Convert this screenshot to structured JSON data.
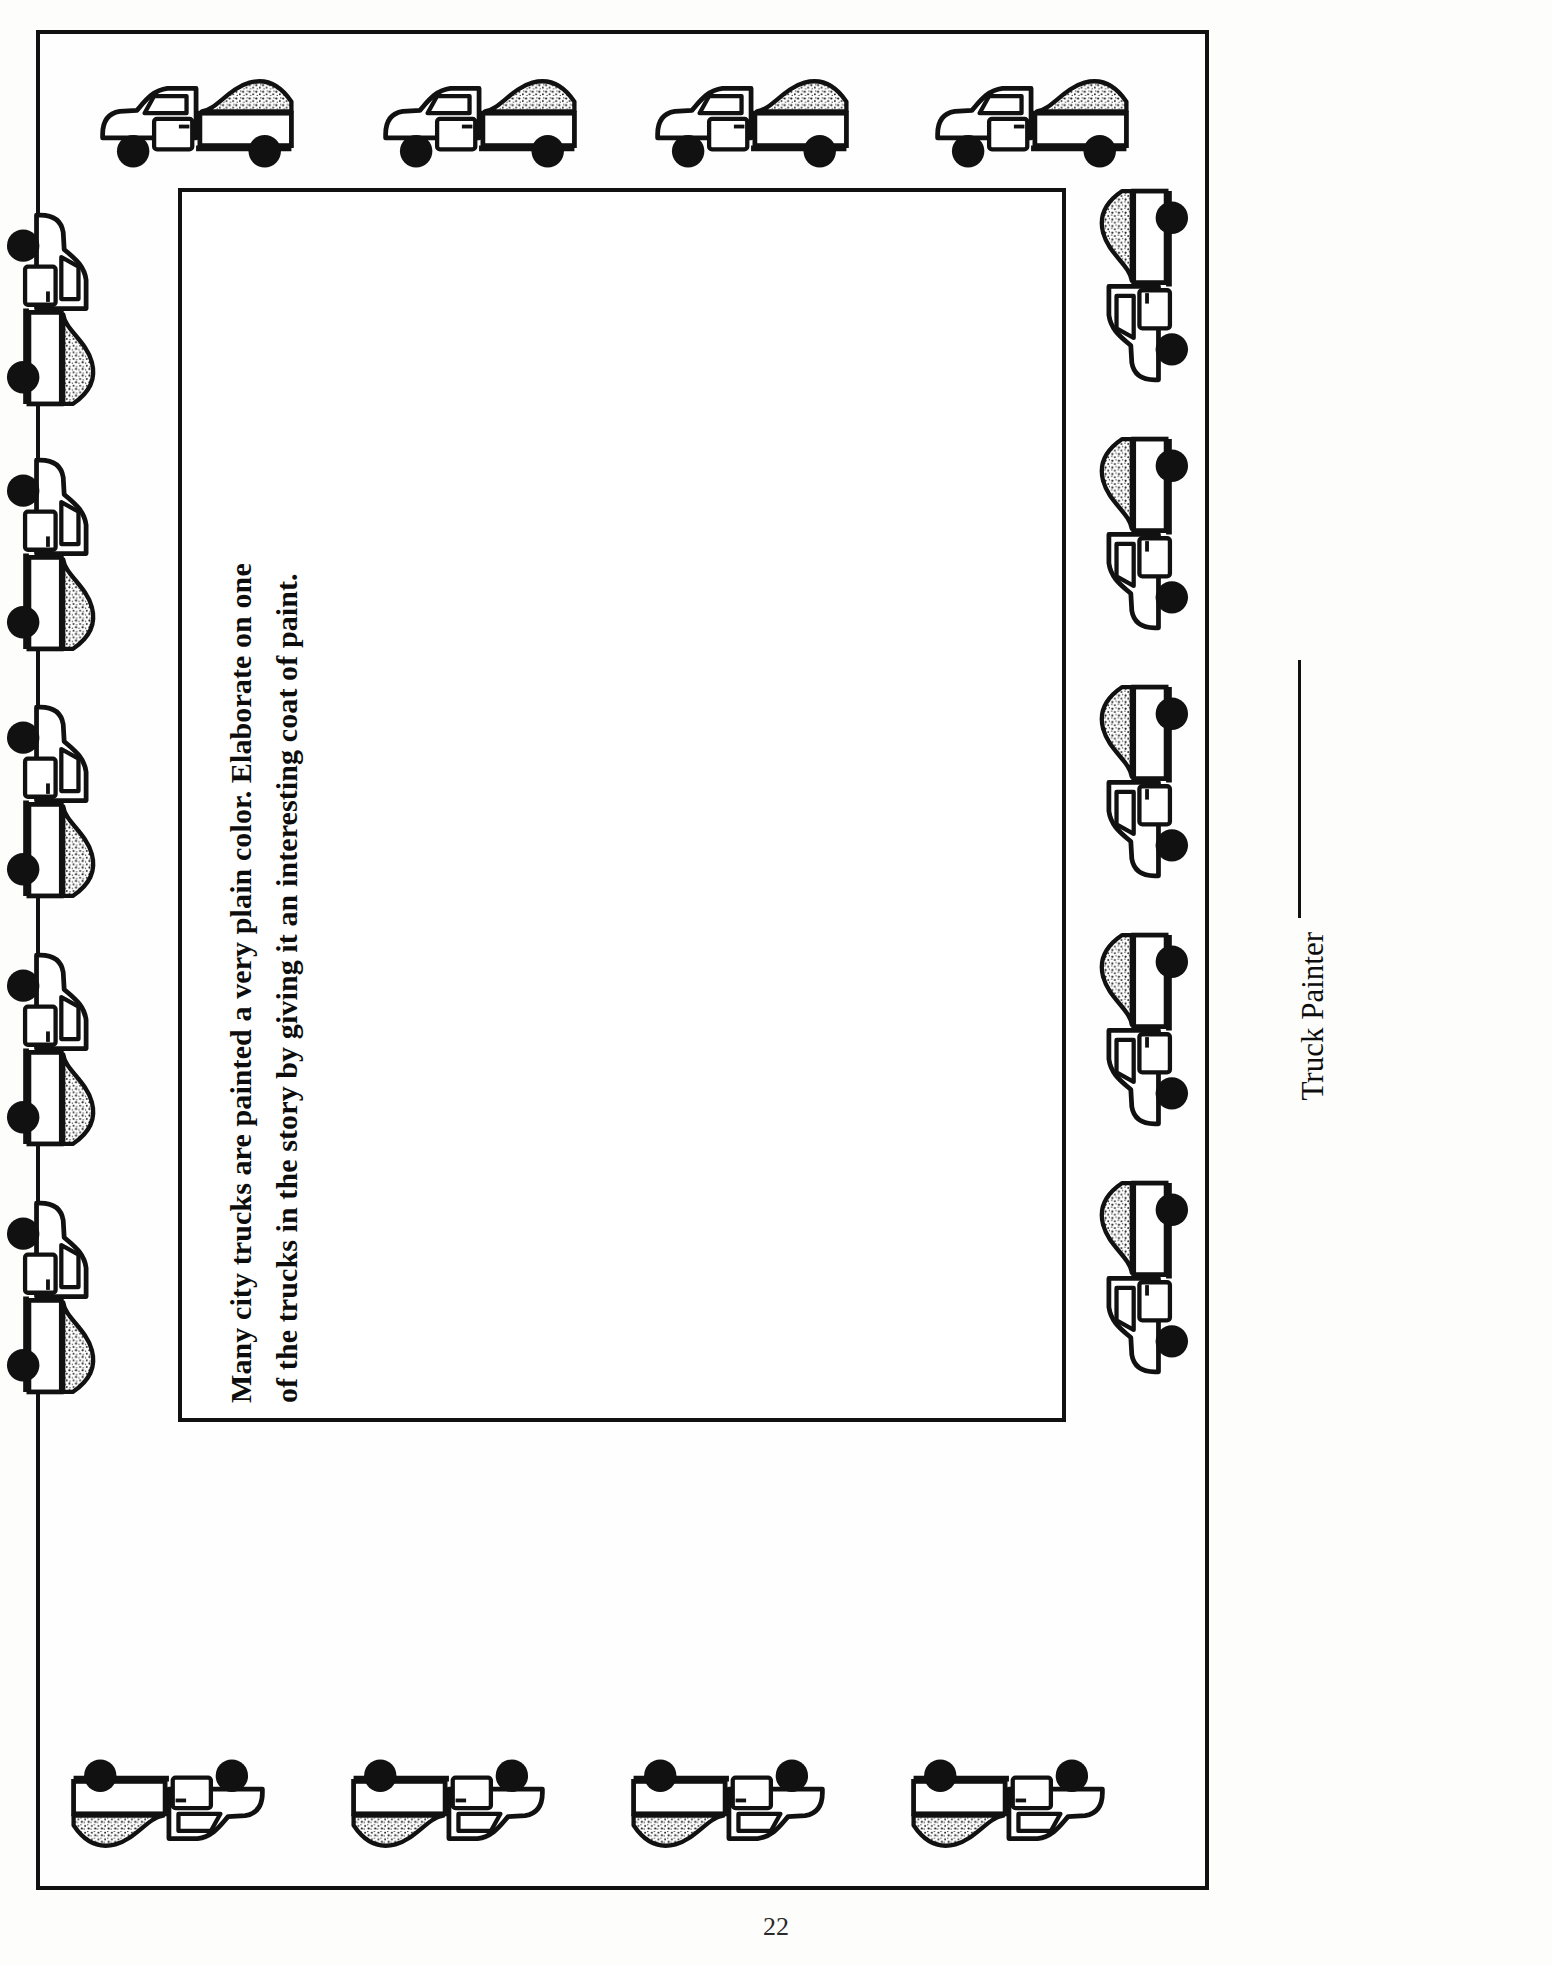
{
  "document": {
    "type": "worksheet",
    "title": "Truck Painter Activity Page",
    "page_number": "22"
  },
  "prompt": {
    "line1": "Many city trucks are painted a very plain color.  Elaborate on one",
    "line2": "of the trucks in the story by giving it an interesting coat of paint."
  },
  "signature": {
    "label": "Truck Painter",
    "rule": ""
  },
  "writing_area": {
    "placeholder": ""
  },
  "border_art": {
    "icon": "dump-truck-icon",
    "description": "dump truck with stippled load",
    "top_count": 4,
    "bottom_count": 4,
    "left_count": 5,
    "right_count": 5
  },
  "colors": {
    "ink": "#111111",
    "paper": "#fdfdfb",
    "stipple": "#1a1a1a"
  }
}
